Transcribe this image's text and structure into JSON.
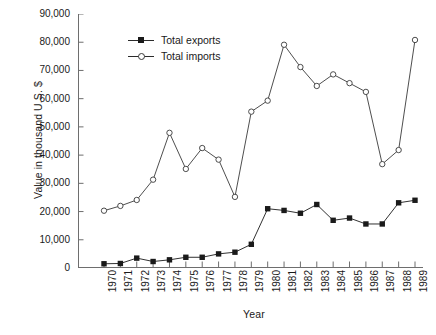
{
  "chart_data": {
    "type": "line",
    "title": "",
    "xlabel": "Year",
    "ylabel": "Value in thousand U.S. $",
    "categories": [
      "1970",
      "1971",
      "1972",
      "1973",
      "1974",
      "1975",
      "1976",
      "1977",
      "1978",
      "1979",
      "1980",
      "1981",
      "1982",
      "1983",
      "1984",
      "1985",
      "1986",
      "1987",
      "1988",
      "1989"
    ],
    "series": [
      {
        "name": "Total exports",
        "marker": "filled-square",
        "color": "#1a1a1a",
        "values": [
          1500,
          1600,
          3500,
          2300,
          2900,
          3800,
          3800,
          5000,
          5600,
          8400,
          21000,
          20400,
          19400,
          22500,
          16900,
          17700,
          15600,
          15600,
          23100,
          24000
        ]
      },
      {
        "name": "Total imports",
        "marker": "open-circle",
        "color": "#3a3a3a",
        "values": [
          20300,
          22000,
          24100,
          31300,
          47900,
          35100,
          42500,
          38400,
          25200,
          55400,
          59300,
          79100,
          71200,
          64500,
          68600,
          65500,
          62400,
          36800,
          41800,
          80800
        ]
      }
    ],
    "ylim": [
      0,
      90000
    ],
    "yticks": [
      0,
      10000,
      20000,
      30000,
      40000,
      50000,
      60000,
      70000,
      80000,
      90000
    ],
    "ytick_labels": [
      "0",
      "10,000",
      "20,000",
      "30,000",
      "40,000",
      "50,000",
      "60,000",
      "70,000",
      "80,000",
      "90,000"
    ],
    "grid": false,
    "legend_position": "top-center-inside"
  },
  "legend": {
    "items": [
      {
        "label": "Total exports",
        "marker": "filled-square"
      },
      {
        "label": "Total imports",
        "marker": "open-circle"
      }
    ]
  },
  "caption": {
    "text": ""
  }
}
